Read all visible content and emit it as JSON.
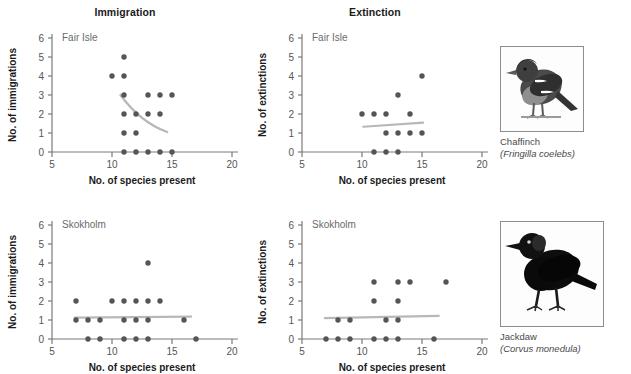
{
  "figure": {
    "column_titles": [
      "Immigration",
      "Extinction"
    ],
    "axis": {
      "xlabel": "No. of species present",
      "xticks": [
        5,
        10,
        15,
        20
      ],
      "xlim": [
        5,
        20
      ],
      "yticks": [
        0,
        1,
        2,
        3,
        4,
        5,
        6
      ],
      "ylim": [
        0,
        6
      ],
      "ylabel_immigration": "No. of immigrations",
      "ylabel_extinction": "No. of extinctions"
    },
    "island_labels": [
      "Fair Isle",
      "Skokholm"
    ],
    "colors": {
      "point": "#555555",
      "trendline": "#b8b8b8",
      "axis": "#7a7a7a",
      "title": "#1b1b1b",
      "inner_label": "#6a6a6a"
    }
  },
  "chart_data": [
    {
      "type": "scatter",
      "title": "Immigration",
      "subtitle": "Fair Isle",
      "xlabel": "No. of species present",
      "ylabel": "No. of immigrations",
      "xlim": [
        5,
        20
      ],
      "ylim": [
        0,
        6
      ],
      "xticks": [
        5,
        10,
        15,
        20
      ],
      "yticks": [
        0,
        1,
        2,
        3,
        4,
        5,
        6
      ],
      "grid": false,
      "legend": "none",
      "points": [
        {
          "x": 11,
          "y": 5
        },
        {
          "x": 10,
          "y": 4
        },
        {
          "x": 11,
          "y": 4
        },
        {
          "x": 11,
          "y": 3
        },
        {
          "x": 13,
          "y": 3
        },
        {
          "x": 14,
          "y": 3
        },
        {
          "x": 15,
          "y": 3
        },
        {
          "x": 11,
          "y": 2
        },
        {
          "x": 12,
          "y": 2
        },
        {
          "x": 13,
          "y": 2
        },
        {
          "x": 14,
          "y": 2
        },
        {
          "x": 11,
          "y": 1
        },
        {
          "x": 12,
          "y": 1
        },
        {
          "x": 11,
          "y": 0
        },
        {
          "x": 12,
          "y": 0
        },
        {
          "x": 13,
          "y": 0
        },
        {
          "x": 14,
          "y": 0
        },
        {
          "x": 15,
          "y": 0
        }
      ],
      "trendline": {
        "shape": "curve-decreasing",
        "start": {
          "x": 10.7,
          "y": 3.0
        },
        "control": {
          "x": 12.4,
          "y": 1.55
        },
        "end": {
          "x": 14.6,
          "y": 1.05
        }
      }
    },
    {
      "type": "scatter",
      "title": "Extinction",
      "subtitle": "Fair Isle",
      "xlabel": "No. of species present",
      "ylabel": "No. of extinctions",
      "xlim": [
        5,
        20
      ],
      "ylim": [
        0,
        6
      ],
      "xticks": [
        5,
        10,
        15,
        20
      ],
      "yticks": [
        0,
        1,
        2,
        3,
        4,
        5,
        6
      ],
      "grid": false,
      "legend": "none",
      "points": [
        {
          "x": 15,
          "y": 4
        },
        {
          "x": 13,
          "y": 3
        },
        {
          "x": 10,
          "y": 2
        },
        {
          "x": 11,
          "y": 2
        },
        {
          "x": 12,
          "y": 2
        },
        {
          "x": 14,
          "y": 2
        },
        {
          "x": 12,
          "y": 1
        },
        {
          "x": 13,
          "y": 1
        },
        {
          "x": 14,
          "y": 1
        },
        {
          "x": 15,
          "y": 1
        },
        {
          "x": 11,
          "y": 0
        },
        {
          "x": 12,
          "y": 0
        },
        {
          "x": 13,
          "y": 0
        }
      ],
      "trendline": {
        "shape": "line-increasing",
        "start": {
          "x": 10.1,
          "y": 1.33
        },
        "end": {
          "x": 15.1,
          "y": 1.55
        }
      }
    },
    {
      "type": "scatter",
      "title": "Immigration",
      "subtitle": "Skokholm",
      "xlabel": "No. of species present",
      "ylabel": "No. of immigrations",
      "xlim": [
        5,
        20
      ],
      "ylim": [
        0,
        6
      ],
      "xticks": [
        5,
        10,
        15,
        20
      ],
      "yticks": [
        0,
        1,
        2,
        3,
        4,
        5,
        6
      ],
      "grid": false,
      "legend": "none",
      "points": [
        {
          "x": 13,
          "y": 4
        },
        {
          "x": 7,
          "y": 2
        },
        {
          "x": 10,
          "y": 2
        },
        {
          "x": 11,
          "y": 2
        },
        {
          "x": 12,
          "y": 2
        },
        {
          "x": 13,
          "y": 2
        },
        {
          "x": 14,
          "y": 2
        },
        {
          "x": 7,
          "y": 1
        },
        {
          "x": 8,
          "y": 1
        },
        {
          "x": 9,
          "y": 1
        },
        {
          "x": 11,
          "y": 1
        },
        {
          "x": 12,
          "y": 1
        },
        {
          "x": 13,
          "y": 1
        },
        {
          "x": 16,
          "y": 1
        },
        {
          "x": 8,
          "y": 0
        },
        {
          "x": 9,
          "y": 0
        },
        {
          "x": 11,
          "y": 0
        },
        {
          "x": 12,
          "y": 0
        },
        {
          "x": 13,
          "y": 0
        },
        {
          "x": 17,
          "y": 0
        }
      ],
      "trendline": {
        "shape": "line-flat",
        "start": {
          "x": 6.9,
          "y": 1.12
        },
        "end": {
          "x": 16.6,
          "y": 1.18
        }
      }
    },
    {
      "type": "scatter",
      "title": "Extinction",
      "subtitle": "Skokholm",
      "xlabel": "No. of species present",
      "ylabel": "No. of extinctions",
      "xlim": [
        5,
        20
      ],
      "ylim": [
        0,
        6
      ],
      "xticks": [
        5,
        10,
        15,
        20
      ],
      "yticks": [
        0,
        1,
        2,
        3,
        4,
        5,
        6
      ],
      "grid": false,
      "legend": "none",
      "points": [
        {
          "x": 11,
          "y": 3
        },
        {
          "x": 13,
          "y": 3
        },
        {
          "x": 14,
          "y": 3
        },
        {
          "x": 17,
          "y": 3
        },
        {
          "x": 11,
          "y": 2
        },
        {
          "x": 13,
          "y": 2
        },
        {
          "x": 8,
          "y": 1
        },
        {
          "x": 9,
          "y": 1
        },
        {
          "x": 12,
          "y": 1
        },
        {
          "x": 13,
          "y": 1
        },
        {
          "x": 7,
          "y": 0
        },
        {
          "x": 8,
          "y": 0
        },
        {
          "x": 9,
          "y": 0
        },
        {
          "x": 11,
          "y": 0
        },
        {
          "x": 12,
          "y": 0
        },
        {
          "x": 13,
          "y": 0
        },
        {
          "x": 16,
          "y": 0
        }
      ],
      "trendline": {
        "shape": "line-flat",
        "start": {
          "x": 6.9,
          "y": 1.1
        },
        "end": {
          "x": 16.4,
          "y": 1.22
        }
      }
    }
  ],
  "birds": [
    {
      "common_name": "Chaffinch",
      "scientific_name": "(Fringilla coelebs)",
      "image_name": "chaffinch-photo"
    },
    {
      "common_name": "Jackdaw",
      "scientific_name": "(Corvus monedula)",
      "image_name": "jackdaw-photo"
    }
  ]
}
